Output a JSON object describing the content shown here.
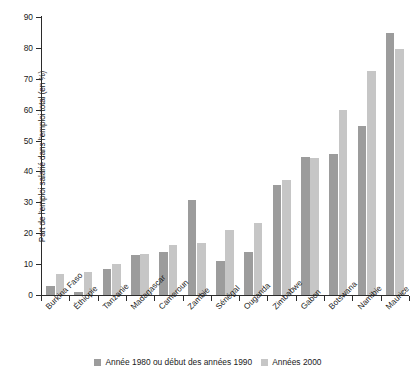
{
  "chart_data": {
    "type": "bar",
    "title": "",
    "subtitle": "",
    "xlabel": "",
    "ylabel": "Part de l'emploi salarié dans l'emploi total (en %)",
    "ylim": [
      0,
      90
    ],
    "ytick_step": 10,
    "yticks": [
      0,
      10,
      20,
      30,
      40,
      50,
      60,
      70,
      80,
      90
    ],
    "ytick_labels": [
      "0",
      "10",
      "20",
      "30",
      "40",
      "50",
      "60",
      "70",
      "80",
      "90"
    ],
    "grid": false,
    "legend_position": "bottom",
    "categories": [
      "Burkina Faso",
      "Éthiopie",
      "Tanzanie",
      "Madagascar",
      "Cameroun",
      "Zambie",
      "Sénégal",
      "Ouganda",
      "Zimbabwe",
      "Gabon",
      "Botswana",
      "Namibie",
      "Maurice"
    ],
    "series": [
      {
        "name": "Année 1980 ou début des années 1990",
        "color": "#9c9c9c",
        "values": [
          3.0,
          1.0,
          8.4,
          13.0,
          14.0,
          30.6,
          11.0,
          13.9,
          35.6,
          44.7,
          45.7,
          54.7,
          84.8
        ]
      },
      {
        "name": "Années 2000",
        "color": "#c6c6c6",
        "values": [
          6.7,
          7.5,
          10.2,
          13.2,
          16.1,
          16.8,
          21.2,
          23.4,
          37.3,
          44.4,
          59.9,
          72.4,
          79.7
        ]
      }
    ]
  },
  "legend": {
    "items": [
      {
        "label": "Année 1980 ou début des années 1990",
        "color": "#9c9c9c"
      },
      {
        "label": "Années 2000",
        "color": "#c6c6c6"
      }
    ]
  },
  "colors": {
    "series_1": "#9c9c9c",
    "series_2": "#c6c6c6",
    "axis": "#2b2b2b",
    "text": "#1a1a1a",
    "background": "#ffffff"
  }
}
